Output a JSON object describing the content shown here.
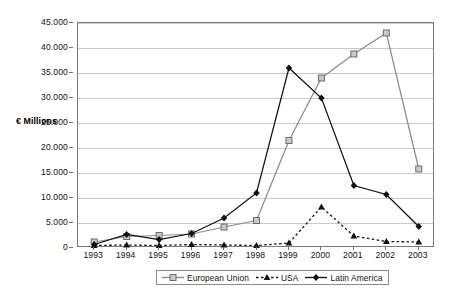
{
  "chart_data": {
    "type": "line",
    "title": "",
    "xlabel": "",
    "ylabel": "€ Millions",
    "categories": [
      "1993",
      "1994",
      "1995",
      "1996",
      "1997",
      "1998",
      "1999",
      "2000",
      "2001",
      "2002",
      "2003"
    ],
    "ylim": [
      0,
      45000
    ],
    "ytick_values": [
      0,
      5000,
      10000,
      15000,
      20000,
      25000,
      30000,
      35000,
      40000,
      45000
    ],
    "ytick_labels": [
      "0",
      "5.000",
      "10.000",
      "15.000",
      "20.000",
      "25.000",
      "30.000",
      "35.000",
      "40.000",
      "45.000"
    ],
    "grid": true,
    "legend_position": "bottom",
    "series": [
      {
        "name": "European Union",
        "color": "#8c8c8c",
        "marker": "open-square",
        "linestyle": "solid",
        "values": [
          1200,
          2300,
          2500,
          2800,
          4200,
          5500,
          21500,
          34000,
          38800,
          43000,
          15800
        ]
      },
      {
        "name": "USA",
        "color": "#111111",
        "marker": "triangle",
        "linestyle": "dashed",
        "values": [
          500,
          600,
          500,
          700,
          600,
          500,
          1000,
          8200,
          2400,
          1300,
          1200
        ]
      },
      {
        "name": "Latin America",
        "color": "#111111",
        "marker": "diamond",
        "linestyle": "solid",
        "values": [
          700,
          2700,
          1700,
          2900,
          6000,
          11000,
          36000,
          30000,
          12500,
          10700,
          4300
        ]
      }
    ]
  },
  "legend": {
    "items": [
      {
        "label": "European Union"
      },
      {
        "label": "USA"
      },
      {
        "label": "Latin America"
      }
    ]
  },
  "axis": {
    "y_title": "€ Millions"
  }
}
